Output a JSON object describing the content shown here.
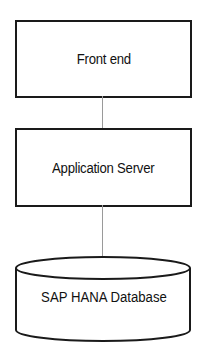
{
  "diagram": {
    "nodes": [
      {
        "id": "front-end",
        "label": "Front end",
        "shape": "rectangle"
      },
      {
        "id": "application-server",
        "label": "Application Server",
        "shape": "rectangle"
      },
      {
        "id": "sap-hana-database",
        "label": "SAP HANA Database",
        "shape": "cylinder"
      }
    ],
    "edges": [
      {
        "from": "front-end",
        "to": "application-server"
      },
      {
        "from": "application-server",
        "to": "sap-hana-database"
      }
    ],
    "colors": {
      "stroke": "#1a1a1a",
      "connector": "#9a9a9a",
      "background": "#ffffff"
    }
  }
}
